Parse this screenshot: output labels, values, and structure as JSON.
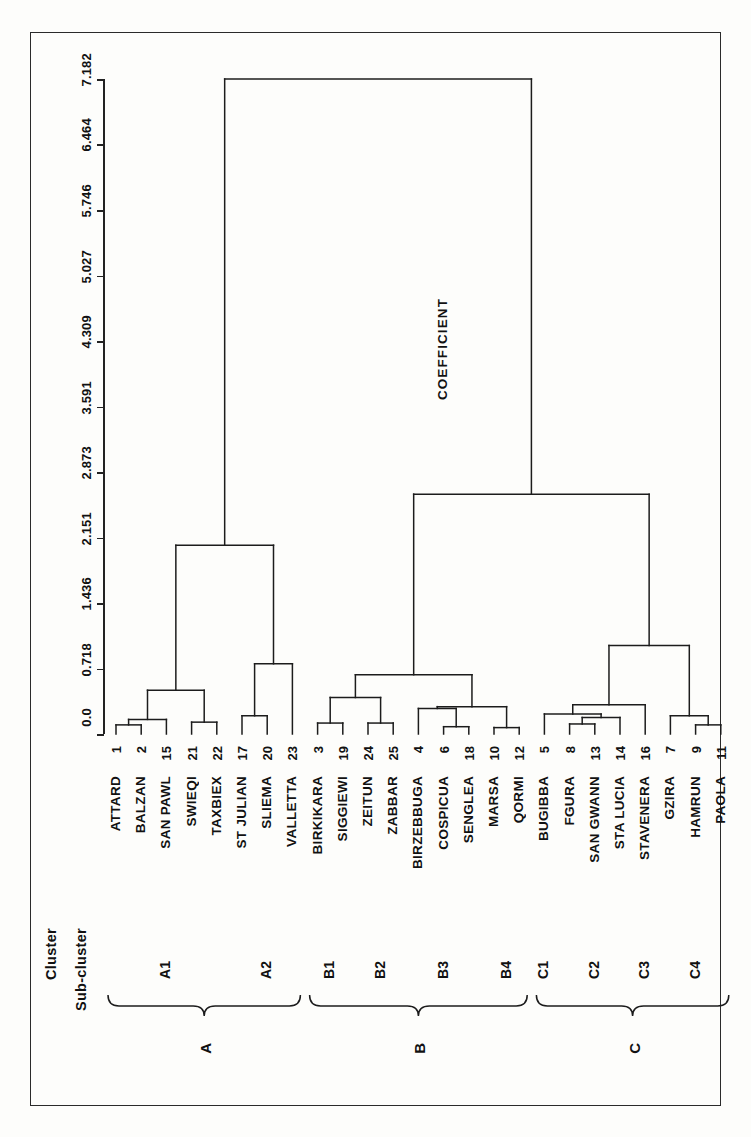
{
  "figure": {
    "axis_title": "COEFFICIENT",
    "column_headers": {
      "cluster": "Cluster",
      "subcluster": "Sub-cluster"
    }
  },
  "chart_data": {
    "type": "dendrogram",
    "title": "",
    "orientation": "horizontal-leaves-bottom",
    "xlabel": "",
    "ylabel": "COEFFICIENT",
    "axis_ticks": [
      "0.0",
      "0.718",
      "1.436",
      "2.151",
      "2.873",
      "3.591",
      "4.309",
      "5.027",
      "5.746",
      "6.464",
      "7.182"
    ],
    "axis_tick_values": [
      0.0,
      0.718,
      1.436,
      2.151,
      2.873,
      3.591,
      4.309,
      5.027,
      5.746,
      6.464,
      7.182
    ],
    "ylim": [
      0.0,
      7.182
    ],
    "grid": false,
    "legend": "none",
    "leaves": [
      {
        "num": "1",
        "name": "ATTARD",
        "subcluster": "A1",
        "cluster": "A"
      },
      {
        "num": "2",
        "name": "BALZAN",
        "subcluster": "A1",
        "cluster": "A"
      },
      {
        "num": "15",
        "name": "SAN PAWL",
        "subcluster": "A1",
        "cluster": "A"
      },
      {
        "num": "21",
        "name": "SWIEQI",
        "subcluster": "A1",
        "cluster": "A"
      },
      {
        "num": "22",
        "name": "TAXBIEX",
        "subcluster": "A1",
        "cluster": "A"
      },
      {
        "num": "17",
        "name": "ST JULIAN",
        "subcluster": "A2",
        "cluster": "A"
      },
      {
        "num": "20",
        "name": "SLIEMA",
        "subcluster": "A2",
        "cluster": "A"
      },
      {
        "num": "23",
        "name": "VALLETTA",
        "subcluster": "A2",
        "cluster": "A"
      },
      {
        "num": "3",
        "name": "BIRKIKARA",
        "subcluster": "B1",
        "cluster": "B"
      },
      {
        "num": "19",
        "name": "SIGGIEWI",
        "subcluster": "B1",
        "cluster": "B"
      },
      {
        "num": "24",
        "name": "ZEITUN",
        "subcluster": "B2",
        "cluster": "B"
      },
      {
        "num": "25",
        "name": "ZABBAR",
        "subcluster": "B2",
        "cluster": "B"
      },
      {
        "num": "4",
        "name": "BIRZEBBUGA",
        "subcluster": "B3",
        "cluster": "B"
      },
      {
        "num": "6",
        "name": "COSPICUA",
        "subcluster": "B3",
        "cluster": "B"
      },
      {
        "num": "18",
        "name": "SENGLEA",
        "subcluster": "B3",
        "cluster": "B"
      },
      {
        "num": "10",
        "name": "MARSA",
        "subcluster": "B4",
        "cluster": "B"
      },
      {
        "num": "12",
        "name": "QORMI",
        "subcluster": "B4",
        "cluster": "B"
      },
      {
        "num": "5",
        "name": "BUGIBBA",
        "subcluster": "C1",
        "cluster": "C"
      },
      {
        "num": "8",
        "name": "FGURA",
        "subcluster": "C2",
        "cluster": "C"
      },
      {
        "num": "13",
        "name": "SAN GWANN",
        "subcluster": "C2",
        "cluster": "C"
      },
      {
        "num": "14",
        "name": "STA LUCIA",
        "subcluster": "C2",
        "cluster": "C"
      },
      {
        "num": "16",
        "name": "STAVENERA",
        "subcluster": "C3",
        "cluster": "C"
      },
      {
        "num": "7",
        "name": "GZIRA",
        "subcluster": "C4",
        "cluster": "C"
      },
      {
        "num": "9",
        "name": "HAMRUN",
        "subcluster": "C4",
        "cluster": "C"
      },
      {
        "num": "11",
        "name": "PAOLA",
        "subcluster": "C4",
        "cluster": "C"
      }
    ],
    "subclusters": [
      {
        "label": "A1",
        "cluster": "A",
        "first": 0,
        "last": 4
      },
      {
        "label": "A2",
        "cluster": "A",
        "first": 5,
        "last": 7
      },
      {
        "label": "B1",
        "cluster": "B",
        "first": 8,
        "last": 9
      },
      {
        "label": "B2",
        "cluster": "B",
        "first": 10,
        "last": 11
      },
      {
        "label": "B3",
        "cluster": "B",
        "first": 12,
        "last": 14
      },
      {
        "label": "B4",
        "cluster": "B",
        "first": 15,
        "last": 16
      },
      {
        "label": "C1",
        "cluster": "C",
        "first": 17,
        "last": 17
      },
      {
        "label": "C2",
        "cluster": "C",
        "first": 18,
        "last": 20
      },
      {
        "label": "C3",
        "cluster": "C",
        "first": 21,
        "last": 21
      },
      {
        "label": "C4",
        "cluster": "C",
        "first": 22,
        "last": 24
      }
    ],
    "clusters": [
      {
        "label": "A",
        "first": 0,
        "last": 7
      },
      {
        "label": "B",
        "first": 8,
        "last": 16
      },
      {
        "label": "C",
        "first": 17,
        "last": 24
      }
    ],
    "merges": [
      {
        "a": {
          "leaf": 0
        },
        "b": {
          "leaf": 1
        },
        "height": 0.1,
        "id": "m1"
      },
      {
        "a": {
          "node": "m1"
        },
        "b": {
          "leaf": 2
        },
        "height": 0.16,
        "id": "m2"
      },
      {
        "a": {
          "leaf": 3
        },
        "b": {
          "leaf": 4
        },
        "height": 0.13,
        "id": "m3"
      },
      {
        "a": {
          "node": "m2"
        },
        "b": {
          "node": "m3"
        },
        "height": 0.48,
        "id": "m4"
      },
      {
        "a": {
          "leaf": 5
        },
        "b": {
          "leaf": 6
        },
        "height": 0.2,
        "id": "m5"
      },
      {
        "a": {
          "node": "m5"
        },
        "b": {
          "leaf": 7
        },
        "height": 0.77,
        "id": "m6"
      },
      {
        "a": {
          "node": "m4"
        },
        "b": {
          "node": "m6"
        },
        "height": 2.07,
        "id": "m7"
      },
      {
        "a": {
          "leaf": 8
        },
        "b": {
          "leaf": 9
        },
        "height": 0.12,
        "id": "m8"
      },
      {
        "a": {
          "leaf": 10
        },
        "b": {
          "leaf": 11
        },
        "height": 0.12,
        "id": "m9"
      },
      {
        "a": {
          "node": "m8"
        },
        "b": {
          "node": "m9"
        },
        "height": 0.4,
        "id": "m10"
      },
      {
        "a": {
          "leaf": 13
        },
        "b": {
          "leaf": 14
        },
        "height": 0.08,
        "id": "m11"
      },
      {
        "a": {
          "leaf": 12
        },
        "b": {
          "node": "m11"
        },
        "height": 0.28,
        "id": "m12"
      },
      {
        "a": {
          "leaf": 15
        },
        "b": {
          "leaf": 16
        },
        "height": 0.07,
        "id": "m13"
      },
      {
        "a": {
          "node": "m12"
        },
        "b": {
          "node": "m13"
        },
        "height": 0.3,
        "id": "m14"
      },
      {
        "a": {
          "node": "m10"
        },
        "b": {
          "node": "m14"
        },
        "height": 0.65,
        "id": "m15"
      },
      {
        "a": {
          "leaf": 18
        },
        "b": {
          "leaf": 19
        },
        "height": 0.11,
        "id": "m16"
      },
      {
        "a": {
          "node": "m16"
        },
        "b": {
          "leaf": 20
        },
        "height": 0.18,
        "id": "m17"
      },
      {
        "a": {
          "leaf": 17
        },
        "b": {
          "node": "m17"
        },
        "height": 0.22,
        "id": "m18"
      },
      {
        "a": {
          "node": "m18"
        },
        "b": {
          "leaf": 21
        },
        "height": 0.32,
        "id": "m19"
      },
      {
        "a": {
          "leaf": 23
        },
        "b": {
          "leaf": 24
        },
        "height": 0.1,
        "id": "m20"
      },
      {
        "a": {
          "leaf": 22
        },
        "b": {
          "node": "m20"
        },
        "height": 0.2,
        "id": "m21"
      },
      {
        "a": {
          "node": "m19"
        },
        "b": {
          "node": "m21"
        },
        "height": 0.97,
        "id": "m22"
      },
      {
        "a": {
          "node": "m15"
        },
        "b": {
          "node": "m22"
        },
        "height": 2.63,
        "id": "m23"
      },
      {
        "a": {
          "node": "m7"
        },
        "b": {
          "node": "m23"
        },
        "height": 7.182,
        "id": "m24"
      }
    ]
  }
}
